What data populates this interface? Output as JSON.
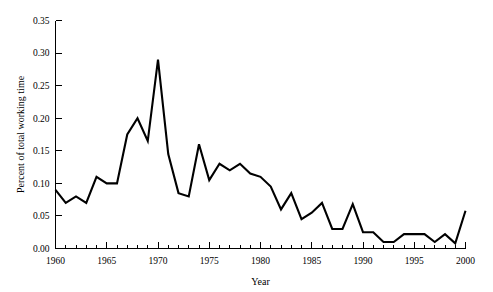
{
  "chart_data": {
    "type": "line",
    "title": "",
    "xlabel": "Year",
    "ylabel": "Percent of total working time",
    "xlim": [
      1960,
      2000
    ],
    "ylim": [
      0.0,
      0.35
    ],
    "grid": false,
    "legend": null,
    "x_major_ticks": [
      1960,
      1965,
      1970,
      1975,
      1980,
      1985,
      1990,
      1995,
      2000
    ],
    "x_major_tick_labels": [
      "1960",
      "1965",
      "1970",
      "1975",
      "1980",
      "1985",
      "1990",
      "1995",
      "2000"
    ],
    "x_minor_tick_step": 1,
    "y_ticks": [
      0.0,
      0.05,
      0.1,
      0.15,
      0.2,
      0.25,
      0.3,
      0.35
    ],
    "y_tick_labels": [
      "0.00",
      "0.05",
      "0.10",
      "0.15",
      "0.20",
      "0.25",
      "0.30",
      "0.35"
    ],
    "series_name": "Percent of total working time",
    "line_color": "#000000",
    "x": [
      1960,
      1961,
      1962,
      1963,
      1964,
      1965,
      1966,
      1967,
      1968,
      1969,
      1970,
      1971,
      1972,
      1973,
      1974,
      1975,
      1976,
      1977,
      1978,
      1979,
      1980,
      1981,
      1982,
      1983,
      1984,
      1985,
      1986,
      1987,
      1988,
      1989,
      1990,
      1991,
      1992,
      1993,
      1994,
      1995,
      1996,
      1997,
      1998,
      1999,
      2000
    ],
    "values": [
      0.09,
      0.07,
      0.08,
      0.07,
      0.11,
      0.1,
      0.1,
      0.175,
      0.2,
      0.165,
      0.29,
      0.145,
      0.085,
      0.08,
      0.16,
      0.105,
      0.13,
      0.12,
      0.13,
      0.115,
      0.11,
      0.095,
      0.06,
      0.085,
      0.045,
      0.055,
      0.07,
      0.03,
      0.03,
      0.068,
      0.025,
      0.025,
      0.01,
      0.01,
      0.022,
      0.022,
      0.022,
      0.01,
      0.022,
      0.008,
      0.058
    ]
  },
  "axes": {
    "y_axis_title": "Percent of total working time",
    "x_axis_title": "Year"
  }
}
